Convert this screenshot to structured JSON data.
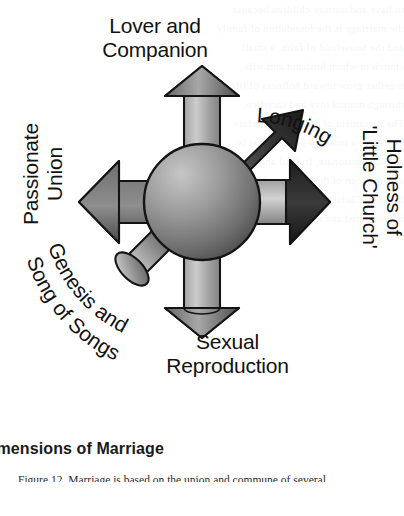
{
  "figure": {
    "type": "radial-arrow-diagram",
    "center_label": "",
    "spokes": [
      {
        "id": "lover-and-companion",
        "label": "Lover and\nCompanion",
        "direction": "up",
        "arrow_style": "3d-cylinder",
        "points": "outward"
      },
      {
        "id": "longing",
        "label": "Longing",
        "direction": "up-right",
        "arrow_style": "flat-arc",
        "points": "outward",
        "text_shape": "arc"
      },
      {
        "id": "holness-little-church",
        "label_line1": "Holness of",
        "label_line2": "'Little Church'",
        "direction": "right",
        "arrow_style": "flat-block",
        "points": "outward"
      },
      {
        "id": "sexual-reproduction",
        "label": "Sexual\nReproduction",
        "direction": "down",
        "arrow_style": "3d-cylinder",
        "points": "outward"
      },
      {
        "id": "genesis-song-of-songs",
        "label": "Genesis and\nSong of Songs",
        "direction": "down-left",
        "arrow_style": "3d-cylinder",
        "points": "inward",
        "text_shape": "arc"
      },
      {
        "id": "passionate-union",
        "label_line1": "Passionate",
        "label_line2": "Union",
        "direction": "left",
        "arrow_style": "flat-block",
        "points": "outward"
      }
    ]
  },
  "labels": {
    "top": "Lover and\nCompanion",
    "bottom": "Sexual\nReproduction",
    "left": "Passionate\nUnion",
    "right": "Holness of\n'Little Church'",
    "arc_upper_right": "Longing",
    "arc_lower_left_1": "Genesis and",
    "arc_lower_left_2": "Song of Songs"
  },
  "caption": {
    "title": "imensions of Marriage",
    "body": "Figure 12. Marriage is based on the union and commune of several"
  },
  "colors": {
    "page_background": "#ffffff",
    "text": "#111111",
    "sphere_light": "#b9b9b9",
    "sphere_mid": "#8d8d8d",
    "sphere_dark": "#4a4a4a",
    "arrow_light": "#cfcfcf",
    "arrow_mid": "#8a8a8a",
    "arrow_dark": "#3c3c3c",
    "arrow_head_dark": "#2b2b2b",
    "outline": "#141414"
  },
  "ghost_text": [
    "to have and nurture children because",
    "the marriage is the foundation of family",
    "and the household of faith, a small",
    "church in which husband and wife",
    "together grow toward holiness of life",
    "through mutual love and sacrifice.",
    "The sacrament of marriage therefore",
    "expresses a union of persons that is",
    "at once passionate, fruitful and holy,",
    "a living icon of the covenant love",
    "between Christ and the Church which",
    "is celebrated and renewed each day."
  ]
}
